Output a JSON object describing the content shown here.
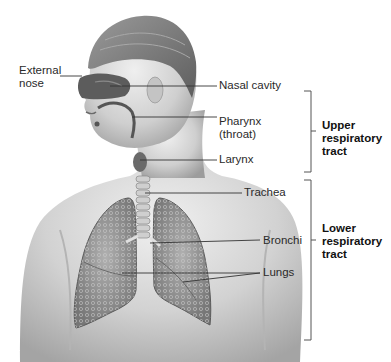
{
  "diagram": {
    "type": "anatomical-illustration",
    "labels": [
      {
        "id": "external-nose",
        "text": "External\nnose"
      },
      {
        "id": "nasal-cavity",
        "text": "Nasal cavity"
      },
      {
        "id": "pharynx",
        "text": "Pharynx\n(throat)"
      },
      {
        "id": "larynx",
        "text": "Larynx"
      },
      {
        "id": "trachea",
        "text": "Trachea"
      },
      {
        "id": "bronchi",
        "text": "Bronchi"
      },
      {
        "id": "lungs",
        "text": "Lungs"
      }
    ],
    "groups": [
      {
        "id": "upper",
        "text": "Upper\nrespiratory\ntract",
        "members": [
          "nasal-cavity",
          "pharynx",
          "larynx"
        ]
      },
      {
        "id": "lower",
        "text": "Lower\nrespiratory\ntract",
        "members": [
          "trachea",
          "bronchi",
          "lungs"
        ]
      }
    ]
  },
  "colors": {
    "background": "#ffffff",
    "leader_line": "#333333",
    "bracket": "#555555",
    "skin_light": "#e4e4e4",
    "skin_mid": "#bdbdbd",
    "skin_dark": "#8e8e8e",
    "hair": "#7a7a7a",
    "lung": "#8a8a8a",
    "airway": "#5a5a5a"
  }
}
